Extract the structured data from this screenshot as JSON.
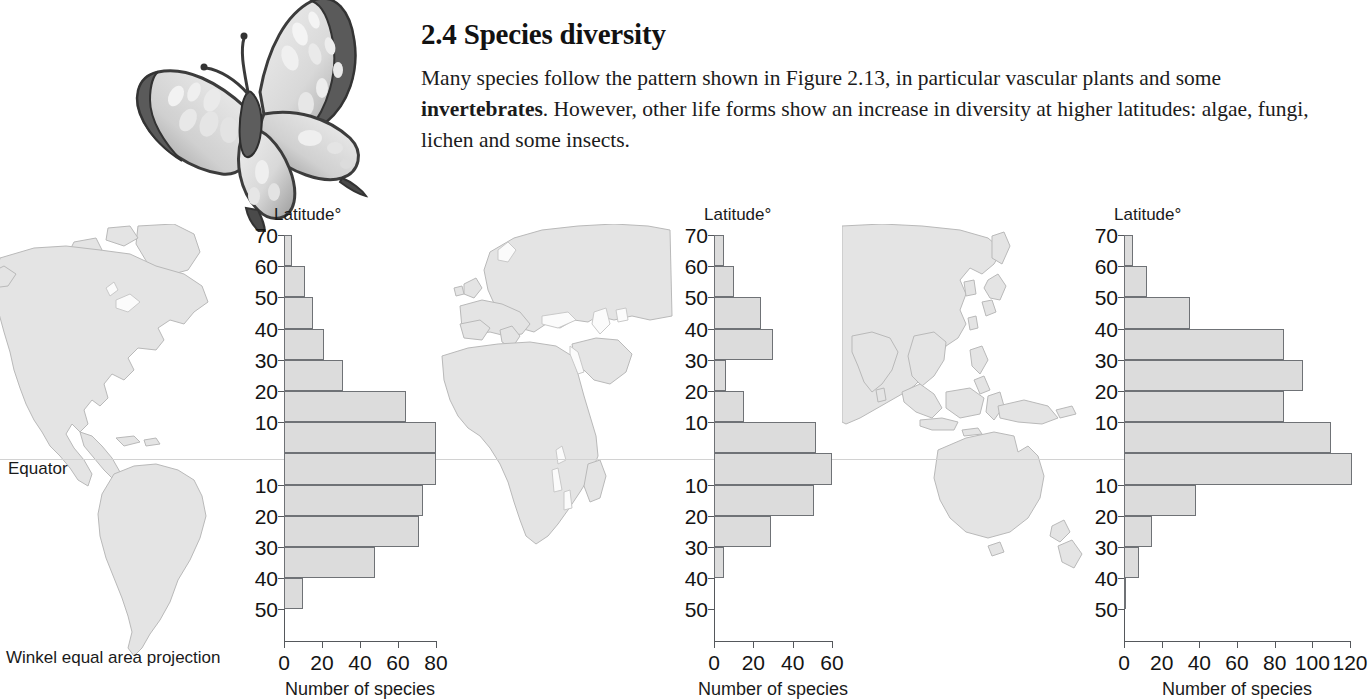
{
  "header": {
    "heading": "2.4 Species diversity",
    "paragraph_part1": "Many species follow the pattern shown in Figure 2.13, in particular vascular plants and some ",
    "paragraph_bold": "invertebrates",
    "paragraph_part2": ". However, other life forms show an increase in diversity at higher latitudes: algae, fungi, lichen and some insects."
  },
  "map": {
    "equator_label": "Equator",
    "projection_caption": "Winkel equal area projection",
    "butterfly_icon": "butterfly-illustration",
    "land_color": "#e4e4e4",
    "land_outline": "#b8b8b8",
    "equator_color": "#d2d2d2"
  },
  "chart_data": [
    {
      "id": "americas",
      "type": "bar",
      "orientation": "horizontal",
      "title": "",
      "ylabel": "Latitude°",
      "xlabel": "Number of species",
      "xlim": [
        0,
        80
      ],
      "xticks": [
        0,
        20,
        40,
        60,
        80
      ],
      "xtick_labels": [
        "0",
        "20",
        "40",
        "60",
        "80"
      ],
      "grid": false,
      "legend": "none",
      "ytick_labels": [
        "70",
        "60",
        "50",
        "40",
        "30",
        "20",
        "10",
        "",
        "10",
        "20",
        "30",
        "40",
        "50"
      ],
      "categories": [
        "60-70 N",
        "50-60 N",
        "40-50 N",
        "30-40 N",
        "20-30 N",
        "10-20 N",
        "0-10 N",
        "0-10 S",
        "10-20 S",
        "20-30 S",
        "30-40 S",
        "40-50 S"
      ],
      "values": [
        4,
        11,
        15,
        21,
        31,
        64,
        80,
        80,
        73,
        71,
        48,
        10
      ]
    },
    {
      "id": "africa-europe",
      "type": "bar",
      "orientation": "horizontal",
      "title": "",
      "ylabel": "Latitude°",
      "xlabel": "Number of species",
      "xlim": [
        0,
        60
      ],
      "xticks": [
        0,
        20,
        40,
        60
      ],
      "xtick_labels": [
        "0",
        "20",
        "40",
        "60"
      ],
      "grid": false,
      "legend": "none",
      "ytick_labels": [
        "70",
        "60",
        "50",
        "40",
        "30",
        "20",
        "10",
        "",
        "10",
        "20",
        "30",
        "40",
        "50"
      ],
      "categories": [
        "60-70 N",
        "50-60 N",
        "40-50 N",
        "30-40 N",
        "20-30 N",
        "10-20 N",
        "0-10 N",
        "0-10 S",
        "10-20 S",
        "20-30 S",
        "30-40 S",
        "40-50 S"
      ],
      "values": [
        5,
        10,
        24,
        30,
        6,
        15,
        52,
        60,
        51,
        29,
        5,
        0
      ]
    },
    {
      "id": "asia-australia",
      "type": "bar",
      "orientation": "horizontal",
      "title": "",
      "ylabel": "Latitude°",
      "xlabel": "Number of species",
      "xlim": [
        0,
        120
      ],
      "xticks": [
        0,
        20,
        40,
        60,
        80,
        100,
        120
      ],
      "xtick_labels": [
        "0",
        "20",
        "40",
        "60",
        "80",
        "100",
        "120"
      ],
      "grid": false,
      "legend": "none",
      "ytick_labels": [
        "70",
        "60",
        "50",
        "40",
        "30",
        "20",
        "10",
        "",
        "10",
        "20",
        "30",
        "40",
        "50"
      ],
      "categories": [
        "60-70 N",
        "50-60 N",
        "40-50 N",
        "30-40 N",
        "20-30 N",
        "10-20 N",
        "0-10 N",
        "0-10 S",
        "10-20 S",
        "20-30 S",
        "30-40 S",
        "40-50 S"
      ],
      "values": [
        5,
        12,
        35,
        85,
        95,
        85,
        110,
        121,
        38,
        15,
        8,
        1
      ]
    }
  ]
}
